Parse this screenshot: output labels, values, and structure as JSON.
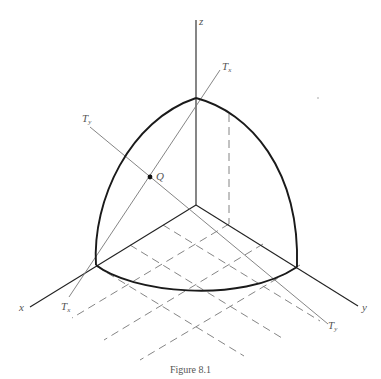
{
  "figure": {
    "caption": "Figure 8.1",
    "labels": {
      "z_axis": "z",
      "x_axis": "x",
      "y_axis": "y",
      "tangent_x_top": "T",
      "tangent_x_top_sub": "x",
      "tangent_x_bottom": "T",
      "tangent_x_bottom_sub": "x",
      "tangent_y_top": "T",
      "tangent_y_top_sub": "y",
      "tangent_y_bottom": "T",
      "tangent_y_bottom_sub": "y",
      "point": "Q"
    },
    "colors": {
      "axis": "#222222",
      "sphere_outline": "#1a1a1a",
      "tangent_lines": "#777777",
      "label_text": "#555555"
    }
  }
}
